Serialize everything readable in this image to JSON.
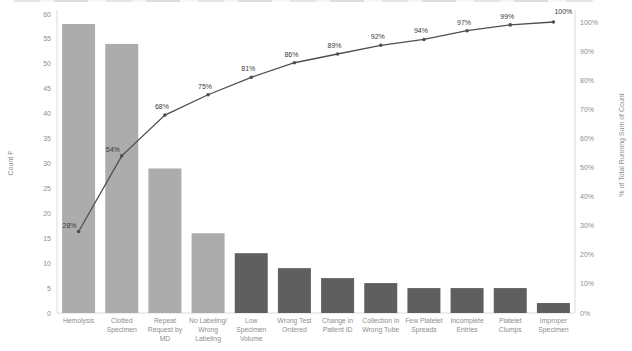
{
  "chart_data": {
    "type": "bar",
    "subtype": "pareto",
    "title": "",
    "categories": [
      {
        "label": "Hemolysis",
        "lines": [
          "Hemolysis"
        ]
      },
      {
        "label": "Clotted Specimen",
        "lines": [
          "Clotted",
          "Specimen"
        ]
      },
      {
        "label": "Repeat Request by MD",
        "lines": [
          "Repeat",
          "Request by",
          "MD"
        ]
      },
      {
        "label": "No Labeling/Wrong Labeling",
        "lines": [
          "No Labeling/",
          "Wrong",
          "Labeling"
        ]
      },
      {
        "label": "Low Specimen Volume",
        "lines": [
          "Low",
          "Specimen",
          "Volume"
        ]
      },
      {
        "label": "Wrong Test Ordered",
        "lines": [
          "Wrong Test",
          "Ordered"
        ]
      },
      {
        "label": "Change in Patient ID",
        "lines": [
          "Change in",
          "Patient ID"
        ]
      },
      {
        "label": "Collection in Wrong Tube",
        "lines": [
          "Collection in",
          "Wrong Tube"
        ]
      },
      {
        "label": "Few Platelet Spreads",
        "lines": [
          "Few Platelet",
          "Spreads"
        ]
      },
      {
        "label": "Incomplete Entries",
        "lines": [
          "Incomplete",
          "Entries"
        ]
      },
      {
        "label": "Platelet Clumps",
        "lines": [
          "Platelet",
          "Clumps"
        ]
      },
      {
        "label": "Improper Specimen",
        "lines": [
          "Improper",
          "Specimen"
        ]
      }
    ],
    "bar_series": {
      "name": "Count",
      "values": [
        58,
        54,
        29,
        16,
        12,
        9,
        7,
        6,
        5,
        5,
        5,
        2
      ]
    },
    "line_series": {
      "name": "% of Total Running Sum of Count",
      "values": [
        28,
        54,
        68,
        75,
        81,
        86,
        89,
        92,
        94,
        97,
        99,
        100
      ],
      "labels": [
        "28%",
        "54%",
        "68%",
        "75%",
        "81%",
        "86%",
        "89%",
        "92%",
        "94%",
        "97%",
        "99%",
        "100%"
      ]
    },
    "light_bar_count": 4,
    "axes": {
      "left": {
        "label": "Count F",
        "min": 0,
        "max": 60,
        "step": 5,
        "ticks": [
          "60",
          "55",
          "50",
          "45",
          "40",
          "35",
          "30",
          "25",
          "20",
          "15",
          "10",
          "5",
          "0"
        ]
      },
      "right": {
        "label": "% of Total Running Sum of Count",
        "min": 0,
        "max": 100,
        "step": 10,
        "ticks": [
          "100%",
          "90%",
          "80%",
          "70%",
          "60%",
          "50%",
          "40%",
          "30%",
          "20%",
          "10%",
          "0%"
        ]
      }
    },
    "legend": "none",
    "grid": "off",
    "colors": {
      "bar_light": "#ACACAC",
      "bar_dark": "#5F5F5F",
      "line": "#4F4F4F",
      "point_label": "#3C3C3C",
      "axis_text": "#8E8E8E",
      "axis_line": "#DBDBDB",
      "background": "#FFFFFF"
    }
  }
}
